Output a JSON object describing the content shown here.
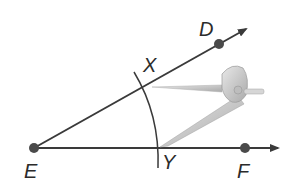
{
  "diagram": {
    "points": {
      "E": {
        "label": "E",
        "x": 34,
        "y": 148
      },
      "D": {
        "label": "D",
        "x": 219,
        "y": 44
      },
      "F": {
        "label": "F",
        "x": 245,
        "y": 148
      },
      "X": {
        "label": "X",
        "x": 144,
        "y": 86
      },
      "Y": {
        "label": "Y",
        "x": 160,
        "y": 148
      }
    },
    "rays": [
      {
        "name": "ray-ED",
        "from": "E",
        "through": "D"
      },
      {
        "name": "ray-EF",
        "from": "E",
        "through": "F"
      }
    ],
    "arc": {
      "name": "arc-XY",
      "center": "E",
      "passes_through": [
        "X",
        "Y"
      ]
    },
    "tool": {
      "name": "compass"
    },
    "colors": {
      "line": "#3a3a3a",
      "point": "#4a4a4a",
      "compass": "#c8c8c8"
    }
  }
}
